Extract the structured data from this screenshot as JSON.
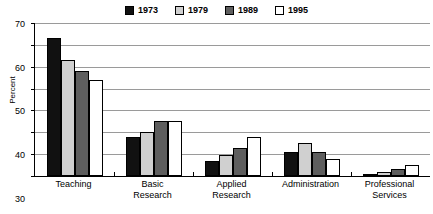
{
  "chart_data": {
    "type": "bar",
    "title": "",
    "xlabel": "",
    "ylabel": "Percent",
    "ylim": [
      0,
      70
    ],
    "yticks": [
      0,
      10,
      20,
      30,
      40,
      50,
      60,
      70
    ],
    "ytick_labels": [
      "0",
      "10",
      "20",
      "30",
      "40",
      "50",
      "60",
      "70"
    ],
    "grid": true,
    "legend_position": "top-center",
    "categories": [
      "Teaching",
      "Basic Research",
      "Applied Research",
      "Administration",
      "Professional Services"
    ],
    "category_lines": [
      [
        "Teaching"
      ],
      [
        "Basic",
        "Research"
      ],
      [
        "Applied",
        "Research"
      ],
      [
        "Administration"
      ],
      [
        "Professional",
        "Services"
      ]
    ],
    "series": [
      {
        "name": "1973",
        "color": "#111111",
        "values": [
          63,
          18,
          7,
          11,
          1
        ]
      },
      {
        "name": "1979",
        "color": "#d0d0d0",
        "values": [
          53,
          20,
          9.5,
          15,
          2
        ]
      },
      {
        "name": "1989",
        "color": "#5e5e5e",
        "values": [
          48,
          25,
          13,
          11,
          3
        ]
      },
      {
        "name": "1995",
        "color": "#ffffff",
        "values": [
          44,
          25,
          18,
          8,
          5
        ]
      }
    ]
  }
}
